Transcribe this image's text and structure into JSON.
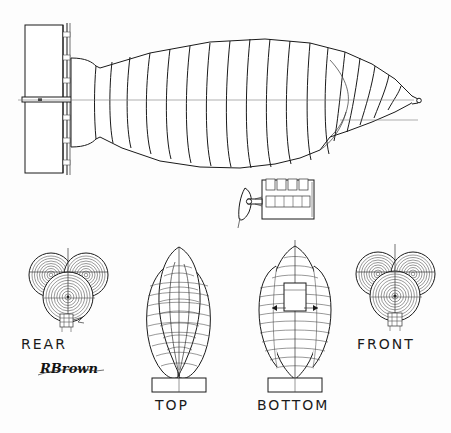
{
  "drawing": {
    "title": "Trilobe Airship Orthographic Views",
    "signature": "RBrown",
    "ink_color": "#1a1a1a",
    "paper_color": "#fdfdfd",
    "centerline_color": "#7a7a7a"
  },
  "views": {
    "side": {
      "name": "side-elevation",
      "hull_bays": 22,
      "has_tail_fin": true,
      "has_gondola": true,
      "has_propeller": true,
      "gondola_upper_windows": 4,
      "gondola_lower_windows": 5
    },
    "rear": {
      "label": "REAR",
      "lobes": 3,
      "rings_per_lobe": 9
    },
    "top": {
      "label": "TOP",
      "lobes": 2,
      "ribs": 17,
      "has_base_plate": true
    },
    "bottom": {
      "label": "BOTTOM",
      "lobes": 1,
      "ribs": 17,
      "has_base_plate": true,
      "has_gondola_box": true
    },
    "front": {
      "label": "FRONT",
      "lobes": 3,
      "rings_per_lobe": 9
    }
  }
}
